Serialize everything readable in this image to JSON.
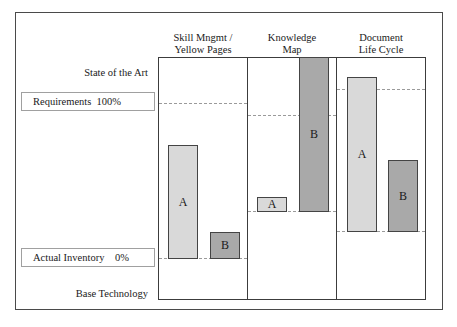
{
  "diagram": {
    "left_labels": {
      "top": "State of the Art",
      "bottom": "Base Technology"
    },
    "levels": {
      "requirements": "Requirements  100%",
      "actual_inventory": "Actual Inventory    0%"
    },
    "columns": [
      {
        "title": "Skill Mngmt /\nYellow Pages",
        "bars": [
          {
            "label": "A",
            "shade": "light"
          },
          {
            "label": "B",
            "shade": "dark"
          }
        ]
      },
      {
        "title": "Knowledge\nMap",
        "bars": [
          {
            "label": "A",
            "shade": "light"
          },
          {
            "label": "B",
            "shade": "dark"
          }
        ]
      },
      {
        "title": "Document\nLife Cycle",
        "bars": [
          {
            "label": "A",
            "shade": "light"
          },
          {
            "label": "B",
            "shade": "dark"
          }
        ]
      }
    ],
    "colors": {
      "bar_light": "#d9d9d9",
      "bar_dark": "#a9a9a9",
      "border": "#3c3c3c",
      "dashed": "#9a9a9a"
    }
  }
}
